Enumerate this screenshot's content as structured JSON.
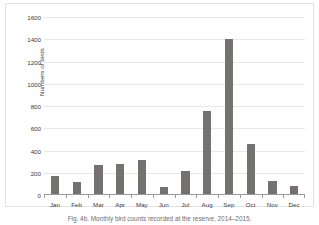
{
  "figure": {
    "caption": "Fig. 4b. Monthly bird counts recorded at the reserve, 2014–2015."
  },
  "chart_data": {
    "type": "bar",
    "title": "",
    "xlabel": "",
    "ylabel": "Numbers of birds",
    "categories": [
      "Jan",
      "Feb",
      "Mar",
      "Apr",
      "May",
      "Jun",
      "Jul",
      "Aug",
      "Sep",
      "Oct",
      "Nov",
      "Dec"
    ],
    "values": [
      165,
      110,
      265,
      275,
      310,
      65,
      210,
      750,
      1405,
      450,
      120,
      70
    ],
    "ylim": [
      0,
      1600
    ],
    "ytick_step": 200,
    "yticks": [
      0,
      200,
      400,
      600,
      800,
      1000,
      1200,
      1400,
      1600
    ],
    "ytick_labels": [
      "0",
      "200",
      "400",
      "600",
      "800",
      "1000",
      "1200",
      "1400",
      "1600"
    ],
    "grid": true,
    "grid_axis": "y",
    "legend": false,
    "legend_position": "none",
    "bar_color": "#767171",
    "gridline_color": "#e8e8e8",
    "axis_color": "#9a9a9a",
    "text_color": "#3b3b3b",
    "plot_border_color": "#e2e2e2"
  }
}
